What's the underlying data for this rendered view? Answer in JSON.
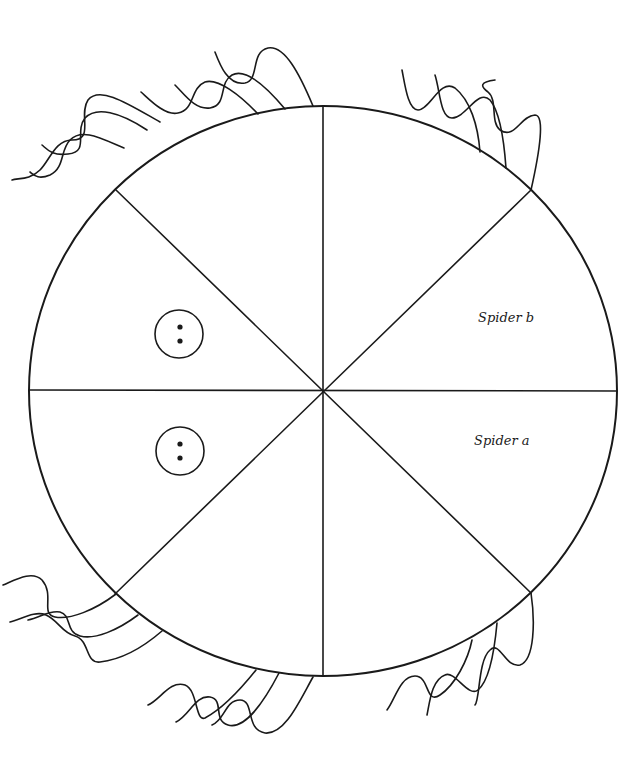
{
  "diagram": {
    "type": "circular-arena",
    "sectors": 8,
    "colors": {
      "stroke": "#1a1a1a",
      "background": "#ffffff"
    },
    "labels": [
      {
        "id": "spider-b",
        "text": "Spider b"
      },
      {
        "id": "spider-a",
        "text": "Spider a"
      }
    ],
    "markers": [
      {
        "id": "marker-upper",
        "description": "circle with two dots"
      },
      {
        "id": "marker-lower",
        "description": "circle with two dots"
      }
    ],
    "legs": [
      {
        "id": "legs-top-left",
        "count": 3
      },
      {
        "id": "legs-top-center",
        "count": 3
      },
      {
        "id": "legs-top-right",
        "count": 3
      },
      {
        "id": "legs-bottom-left",
        "count": 3
      },
      {
        "id": "legs-bottom-center",
        "count": 3
      },
      {
        "id": "legs-bottom-right",
        "count": 3
      }
    ]
  }
}
